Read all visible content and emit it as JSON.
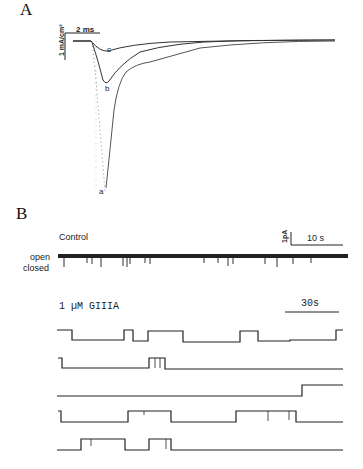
{
  "figure": {
    "panel_a": {
      "letter": "A",
      "scale_bar_time": "2 ms",
      "scale_bar_current": "1 mA/cm²",
      "trace_labels": [
        "a",
        "b",
        "c"
      ],
      "colors": {
        "trace": "#333333",
        "dotted_trace": "#999999"
      }
    },
    "panel_b": {
      "letter": "B",
      "control": {
        "title": "Control",
        "state_labels": [
          "open",
          "closed"
        ],
        "scale_bar_time": "10 s",
        "scale_bar_current": "1pA"
      },
      "drug": {
        "title": "1 µM GIIIA",
        "scale_bar_time": "30s",
        "sweep_count": 5
      }
    }
  }
}
